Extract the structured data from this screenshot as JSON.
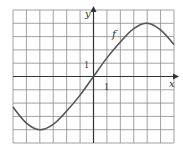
{
  "chart_data": {
    "type": "line",
    "title": "",
    "xlabel": "x",
    "ylabel": "y",
    "curve_label": "f",
    "tick_labels": {
      "x_unit": "1",
      "y_unit": "1"
    },
    "grid": true,
    "xlim": [
      -6,
      6
    ],
    "ylim": [
      -5,
      5
    ],
    "series": [
      {
        "name": "f",
        "x": [
          -6,
          -5,
          -4,
          -3,
          -2,
          -1,
          0,
          1,
          2,
          3,
          4,
          5,
          6
        ],
        "y": [
          -2.3,
          -3.5,
          -4,
          -3.6,
          -2.6,
          -1.4,
          0,
          1.4,
          2.6,
          3.6,
          4,
          3.5,
          2.4
        ]
      }
    ]
  },
  "colors": {
    "grid": "#8a8a8a",
    "axis": "#333333",
    "curve": "#555555"
  }
}
